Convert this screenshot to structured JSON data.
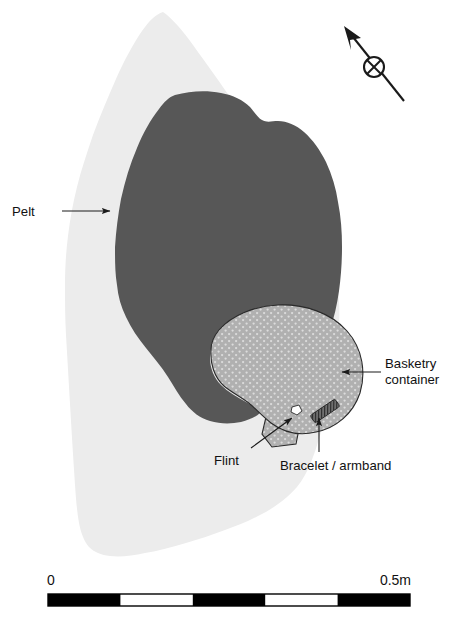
{
  "figure": {
    "type": "archaeological-grave-plan",
    "title": "",
    "colors": {
      "pit_fill": "#ececec",
      "pelt_fill": "#575757",
      "container_fill": "#b0b0b0",
      "container_stipple": "#d8d8d8",
      "artifact_flint": "#ffffff",
      "artifact_bracelet": "#6b6b6b",
      "outline": "#1a1a1a",
      "text": "#111111",
      "background": "#ffffff"
    }
  },
  "labels": {
    "pelt": "Pelt",
    "basketry_line1": "Basketry",
    "basketry_line2": "container",
    "flint": "Flint",
    "bracelet": "Bracelet / armband"
  },
  "north_arrow": {
    "name": "north-arrow",
    "description": "diagonal arrow pointing upper-left with crossed circle at midpoint"
  },
  "scale_bar": {
    "start_label": "0",
    "end_label": "0.5m",
    "segments": 5,
    "segment_colors": [
      "#000000",
      "#ffffff",
      "#000000",
      "#ffffff",
      "#000000"
    ],
    "total_length_m": 0.5
  }
}
